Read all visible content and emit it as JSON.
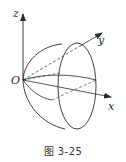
{
  "figure": {
    "caption": "图 3-25",
    "axes": {
      "z_label": "z",
      "y_label": "y",
      "x_label": "x",
      "origin_label": "O"
    },
    "colors": {
      "stroke": "#2a2a2a",
      "background": "#ffffff"
    }
  }
}
